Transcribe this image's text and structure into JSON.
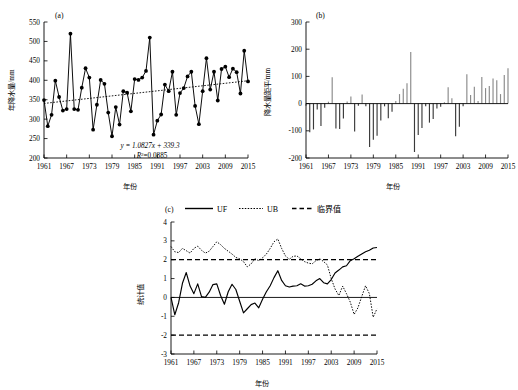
{
  "figure": {
    "panels": {
      "a": {
        "label": "(a)"
      },
      "b": {
        "label": "(b)"
      },
      "c": {
        "label": "(c)"
      }
    }
  },
  "legend": {
    "uf_label": "UF",
    "ub_label": "UB",
    "crit_label": "临界值"
  },
  "annotations": {
    "trend_equation": "y = 1.0827x + 339.3",
    "r_squared": "R2=0.0885",
    "r_squared_base": "R",
    "r_squared_exp": "2",
    "r_squared_rest": "=0.0885"
  },
  "chart_data": [
    {
      "type": "line",
      "panel": "a",
      "title": "(a)",
      "xlabel": "年份",
      "ylabel": "年降水量/mm",
      "ylim": [
        200,
        550
      ],
      "xlim": [
        1961,
        2015
      ],
      "yticks": [
        200,
        250,
        300,
        350,
        400,
        450,
        500,
        550
      ],
      "xticks": [
        1961,
        1967,
        1973,
        1979,
        1985,
        1991,
        1997,
        2003,
        2009,
        2015
      ],
      "grid": false,
      "legend_position": "none",
      "series": [
        {
          "name": "年降水量",
          "marker": "filled-circle",
          "x": [
            1961,
            1962,
            1963,
            1964,
            1965,
            1966,
            1967,
            1968,
            1969,
            1970,
            1971,
            1972,
            1973,
            1974,
            1975,
            1976,
            1977,
            1978,
            1979,
            1980,
            1981,
            1982,
            1983,
            1984,
            1985,
            1986,
            1987,
            1988,
            1989,
            1990,
            1991,
            1992,
            1993,
            1994,
            1995,
            1996,
            1997,
            1998,
            1999,
            2000,
            2001,
            2002,
            2003,
            2004,
            2005,
            2006,
            2007,
            2008,
            2009,
            2010,
            2011,
            2012,
            2013,
            2014,
            2015
          ],
          "values": [
            349,
            282,
            311,
            399,
            357,
            322,
            326,
            520,
            326,
            324,
            381,
            431,
            407,
            273,
            337,
            401,
            391,
            317,
            256,
            331,
            286,
            372,
            368,
            320,
            403,
            401,
            407,
            424,
            510,
            260,
            296,
            312,
            389,
            372,
            422,
            311,
            367,
            380,
            410,
            422,
            334,
            287,
            372,
            457,
            376,
            422,
            348,
            429,
            435,
            408,
            430,
            421,
            366,
            476,
            397
          ]
        },
        {
          "name": "线性趋势",
          "marker": "none",
          "style": "dotted",
          "x": [
            1961,
            2015
          ],
          "values": [
            340.4,
            398.8
          ]
        }
      ],
      "annotations": [
        "y = 1.0827x + 339.3",
        "R2=0.0885"
      ]
    },
    {
      "type": "bar",
      "panel": "b",
      "title": "(b)",
      "xlabel": "年份",
      "ylabel": "降水量距平/mm",
      "ylim": [
        -200,
        300
      ],
      "xlim": [
        1961,
        2015
      ],
      "yticks": [
        -200,
        -100,
        0,
        100,
        200,
        300
      ],
      "xticks": [
        1961,
        1967,
        1973,
        1979,
        1985,
        1991,
        1997,
        2003,
        2009,
        2015
      ],
      "grid": false,
      "legend_position": "none",
      "categories": [
        1961,
        1962,
        1963,
        1964,
        1965,
        1966,
        1967,
        1968,
        1969,
        1970,
        1971,
        1972,
        1973,
        1974,
        1975,
        1976,
        1977,
        1978,
        1979,
        1980,
        1981,
        1982,
        1983,
        1984,
        1985,
        1986,
        1987,
        1988,
        1989,
        1990,
        1991,
        1992,
        1993,
        1994,
        1995,
        1996,
        1997,
        1998,
        1999,
        2000,
        2001,
        2002,
        2003,
        2004,
        2005,
        2006,
        2007,
        2008,
        2009,
        2010,
        2011,
        2012,
        2013,
        2014,
        2015
      ],
      "values": [
        -8,
        -105,
        -95,
        -22,
        -82,
        -15,
        7,
        97,
        -92,
        -93,
        -55,
        8,
        26,
        -103,
        -8,
        33,
        -10,
        -160,
        -133,
        -118,
        -62,
        -10,
        -54,
        -30,
        10,
        35,
        55,
        75,
        190,
        -178,
        -115,
        -90,
        -10,
        -70,
        -57,
        -18,
        -12,
        5,
        60,
        20,
        -120,
        -85,
        -10,
        108,
        32,
        62,
        10,
        98,
        57,
        65,
        92,
        86,
        35,
        105,
        130
      ]
    },
    {
      "type": "line",
      "panel": "c",
      "title": "(c)",
      "xlabel": "年份",
      "ylabel": "统计值",
      "ylim": [
        -3,
        4
      ],
      "xlim": [
        1961,
        2015
      ],
      "yticks": [
        -3,
        -2,
        -1,
        0,
        1,
        2,
        3,
        4
      ],
      "xticks": [
        1961,
        1967,
        1973,
        1979,
        1985,
        1991,
        1997,
        2003,
        2009,
        2015
      ],
      "grid": false,
      "legend_position": "top",
      "critical_values": [
        2.0,
        -2.0
      ],
      "series": [
        {
          "name": "UF",
          "style": "solid",
          "x": [
            1961,
            1962,
            1963,
            1964,
            1965,
            1966,
            1967,
            1968,
            1969,
            1970,
            1971,
            1972,
            1973,
            1974,
            1975,
            1976,
            1977,
            1978,
            1979,
            1980,
            1981,
            1982,
            1983,
            1984,
            1985,
            1986,
            1987,
            1988,
            1989,
            1990,
            1991,
            1992,
            1993,
            1994,
            1995,
            1996,
            1997,
            1998,
            1999,
            2000,
            2001,
            2002,
            2003,
            2004,
            2005,
            2006,
            2007,
            2008,
            2009,
            2010,
            2011,
            2012,
            2013,
            2014,
            2015
          ],
          "values": [
            0.0,
            -0.92,
            -0.28,
            0.75,
            1.32,
            0.6,
            0.2,
            0.72,
            0.04,
            0.0,
            0.28,
            0.68,
            0.72,
            0.1,
            -0.36,
            0.3,
            0.7,
            0.42,
            -0.2,
            -0.82,
            -0.6,
            -0.38,
            -0.3,
            -0.55,
            -0.1,
            0.3,
            0.62,
            1.05,
            1.42,
            0.9,
            0.62,
            0.55,
            0.6,
            0.62,
            0.72,
            0.6,
            0.62,
            0.7,
            0.88,
            1.0,
            0.78,
            0.72,
            0.95,
            1.3,
            1.45,
            1.62,
            1.68,
            1.95,
            2.05,
            2.18,
            2.3,
            2.42,
            2.5,
            2.62,
            2.65
          ]
        },
        {
          "name": "UB",
          "style": "dotted",
          "x": [
            1961,
            1962,
            1963,
            1964,
            1965,
            1966,
            1967,
            1968,
            1969,
            1970,
            1971,
            1972,
            1973,
            1974,
            1975,
            1976,
            1977,
            1978,
            1979,
            1980,
            1981,
            1982,
            1983,
            1984,
            1985,
            1986,
            1987,
            1988,
            1989,
            1990,
            1991,
            1992,
            1993,
            1994,
            1995,
            1996,
            1997,
            1998,
            1999,
            2000,
            2001,
            2002,
            2003,
            2004,
            2005,
            2006,
            2007,
            2008,
            2009,
            2010,
            2011,
            2012,
            2013,
            2014,
            2015
          ],
          "values": [
            2.7,
            2.42,
            2.38,
            2.6,
            2.48,
            2.35,
            2.6,
            2.72,
            2.5,
            2.35,
            2.45,
            2.7,
            2.95,
            2.8,
            2.6,
            2.45,
            2.3,
            2.12,
            2.05,
            1.9,
            1.62,
            1.78,
            2.05,
            1.95,
            2.1,
            2.3,
            2.6,
            2.95,
            3.1,
            2.6,
            2.2,
            2.02,
            2.18,
            2.2,
            2.05,
            1.9,
            1.82,
            1.78,
            1.95,
            2.05,
            1.9,
            1.72,
            1.0,
            0.45,
            0.1,
            0.6,
            0.2,
            -0.25,
            -0.9,
            -0.55,
            0.05,
            0.62,
            0.2,
            -1.05,
            -0.6
          ]
        }
      ]
    }
  ]
}
